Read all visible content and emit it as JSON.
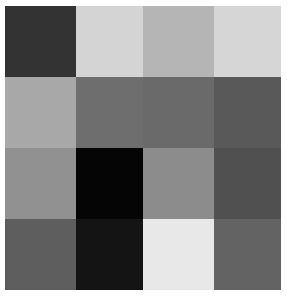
{
  "image": {
    "title": "Grayscale Checker Grid",
    "kind": "grayscale-block-mosaic",
    "width": 287,
    "height": 296,
    "background_color": "#ffffff",
    "grid": {
      "rows": 4,
      "columns": 4
    }
  },
  "chart_data": {
    "type": "heatmap",
    "subtitle": "",
    "xlabel": "",
    "ylabel": "",
    "grid": false,
    "legend_position": "none",
    "colormap": "gray",
    "x": [
      "c1",
      "c2",
      "c3",
      "c4"
    ],
    "y": [
      "r1",
      "r2",
      "r3",
      "r4"
    ],
    "vmin": 0,
    "vmax": 255,
    "values": [
      [
        51,
        212,
        181,
        214
      ],
      [
        168,
        110,
        106,
        89
      ],
      [
        145,
        5,
        140,
        80
      ],
      [
        94,
        20,
        232,
        99
      ]
    ],
    "colors": [
      [
        "#333333",
        "#d4d4d4",
        "#b5b5b5",
        "#d6d6d6"
      ],
      [
        "#a8a8a8",
        "#6e6e6e",
        "#6a6a6a",
        "#595959"
      ],
      [
        "#919191",
        "#050505",
        "#8c8c8c",
        "#505050"
      ],
      [
        "#5e5e5e",
        "#141414",
        "#e8e8e8",
        "#636363"
      ]
    ],
    "annotations": []
  },
  "cells": [
    {
      "row": 1,
      "col": 1,
      "name": "cell-r1c1",
      "color": "#333333",
      "value": 51
    },
    {
      "row": 1,
      "col": 2,
      "name": "cell-r1c2",
      "color": "#d4d4d4",
      "value": 212
    },
    {
      "row": 1,
      "col": 3,
      "name": "cell-r1c3",
      "color": "#b5b5b5",
      "value": 181
    },
    {
      "row": 1,
      "col": 4,
      "name": "cell-r1c4",
      "color": "#d6d6d6",
      "value": 214
    },
    {
      "row": 2,
      "col": 1,
      "name": "cell-r2c1",
      "color": "#a8a8a8",
      "value": 168
    },
    {
      "row": 2,
      "col": 2,
      "name": "cell-r2c2",
      "color": "#6e6e6e",
      "value": 110
    },
    {
      "row": 2,
      "col": 3,
      "name": "cell-r2c3",
      "color": "#6a6a6a",
      "value": 106
    },
    {
      "row": 2,
      "col": 4,
      "name": "cell-r2c4",
      "color": "#595959",
      "value": 89
    },
    {
      "row": 3,
      "col": 1,
      "name": "cell-r3c1",
      "color": "#919191",
      "value": 145
    },
    {
      "row": 3,
      "col": 2,
      "name": "cell-r3c2",
      "color": "#050505",
      "value": 5
    },
    {
      "row": 3,
      "col": 3,
      "name": "cell-r3c3",
      "color": "#8c8c8c",
      "value": 140
    },
    {
      "row": 3,
      "col": 4,
      "name": "cell-r3c4",
      "color": "#505050",
      "value": 80
    },
    {
      "row": 4,
      "col": 1,
      "name": "cell-r4c1",
      "color": "#5e5e5e",
      "value": 94
    },
    {
      "row": 4,
      "col": 2,
      "name": "cell-r4c2",
      "color": "#141414",
      "value": 20
    },
    {
      "row": 4,
      "col": 3,
      "name": "cell-r4c3",
      "color": "#e8e8e8",
      "value": 232
    },
    {
      "row": 4,
      "col": 4,
      "name": "cell-r4c4",
      "color": "#636363",
      "value": 99
    }
  ]
}
